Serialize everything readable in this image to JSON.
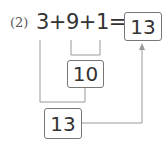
{
  "problem": {
    "number_label": "(2)",
    "expression": "3+9+1=",
    "answer": "13"
  },
  "steps": {
    "partial_sum": "10",
    "final_sum": "13"
  },
  "colors": {
    "line": "#999999",
    "box_border": "#777777",
    "text": "#333333"
  }
}
